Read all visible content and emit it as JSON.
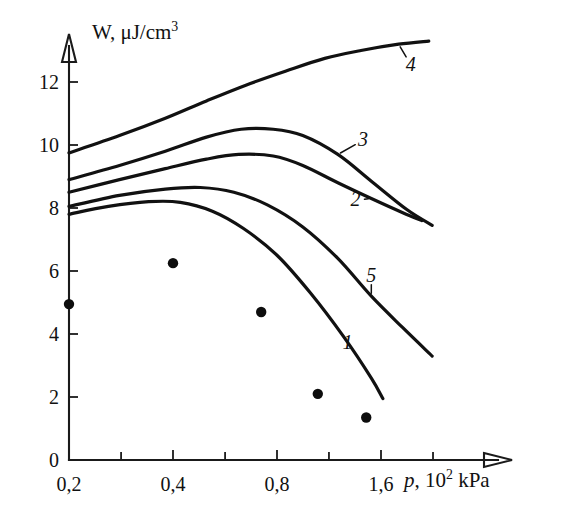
{
  "chart_data": {
    "type": "line",
    "title": "",
    "subtitle": "",
    "xlabel": "p, 10² kPa",
    "ylabel": "W, μJ/cm3",
    "x_axis": {
      "scale": "log2",
      "tick_labels": [
        "0,2",
        "0,4",
        "0,8",
        "1,6"
      ],
      "tick_values": [
        0.2,
        0.4,
        0.8,
        1.6
      ],
      "minor_ticks": [
        0.283,
        0.566,
        1.131,
        2.263
      ],
      "xlim": [
        0.2,
        2.4
      ]
    },
    "y_axis": {
      "scale": "linear",
      "tick_labels": [
        "0",
        "2",
        "4",
        "6",
        "8",
        "10",
        "12"
      ],
      "tick_values": [
        0,
        2,
        4,
        6,
        8,
        10,
        12
      ],
      "ylim": [
        0,
        13.6
      ]
    },
    "grid": false,
    "legend": "inline-curve-labels",
    "series": [
      {
        "name": "1",
        "label": "1",
        "style": "solid-line",
        "points": [
          {
            "x": 0.2,
            "y": 7.8
          },
          {
            "x": 0.26,
            "y": 8.05
          },
          {
            "x": 0.34,
            "y": 8.2
          },
          {
            "x": 0.42,
            "y": 8.18
          },
          {
            "x": 0.52,
            "y": 7.9
          },
          {
            "x": 0.64,
            "y": 7.35
          },
          {
            "x": 0.8,
            "y": 6.5
          },
          {
            "x": 1.0,
            "y": 5.3
          },
          {
            "x": 1.25,
            "y": 3.9
          },
          {
            "x": 1.5,
            "y": 2.6
          },
          {
            "x": 1.62,
            "y": 1.95
          }
        ],
        "label_position": {
          "x": 1.28,
          "y": 3.7
        }
      },
      {
        "name": "2",
        "label": "2",
        "style": "solid-line",
        "points": [
          {
            "x": 0.2,
            "y": 8.5
          },
          {
            "x": 0.28,
            "y": 8.9
          },
          {
            "x": 0.38,
            "y": 9.25
          },
          {
            "x": 0.5,
            "y": 9.55
          },
          {
            "x": 0.62,
            "y": 9.7
          },
          {
            "x": 0.78,
            "y": 9.65
          },
          {
            "x": 0.95,
            "y": 9.35
          },
          {
            "x": 1.2,
            "y": 8.8
          },
          {
            "x": 1.5,
            "y": 8.3
          },
          {
            "x": 1.85,
            "y": 7.85
          },
          {
            "x": 2.1,
            "y": 7.6
          }
        ],
        "label_position": {
          "x": 1.35,
          "y": 8.25
        }
      },
      {
        "name": "3",
        "label": "3",
        "style": "solid-line",
        "points": [
          {
            "x": 0.2,
            "y": 8.9
          },
          {
            "x": 0.28,
            "y": 9.35
          },
          {
            "x": 0.38,
            "y": 9.8
          },
          {
            "x": 0.5,
            "y": 10.25
          },
          {
            "x": 0.63,
            "y": 10.5
          },
          {
            "x": 0.78,
            "y": 10.5
          },
          {
            "x": 0.95,
            "y": 10.3
          },
          {
            "x": 1.2,
            "y": 9.7
          },
          {
            "x": 1.5,
            "y": 8.85
          },
          {
            "x": 1.9,
            "y": 7.95
          },
          {
            "x": 2.25,
            "y": 7.45
          }
        ],
        "label_position": {
          "x": 1.42,
          "y": 10.15
        }
      },
      {
        "name": "4",
        "label": "4",
        "style": "solid-line",
        "points": [
          {
            "x": 0.2,
            "y": 9.75
          },
          {
            "x": 0.28,
            "y": 10.3
          },
          {
            "x": 0.38,
            "y": 10.85
          },
          {
            "x": 0.5,
            "y": 11.4
          },
          {
            "x": 0.65,
            "y": 11.9
          },
          {
            "x": 0.85,
            "y": 12.35
          },
          {
            "x": 1.1,
            "y": 12.75
          },
          {
            "x": 1.4,
            "y": 13.0
          },
          {
            "x": 1.8,
            "y": 13.2
          },
          {
            "x": 2.2,
            "y": 13.3
          }
        ],
        "label_position": {
          "x": 1.95,
          "y": 12.55
        }
      },
      {
        "name": "5",
        "label": "5",
        "style": "solid-line",
        "points": [
          {
            "x": 0.2,
            "y": 8.05
          },
          {
            "x": 0.28,
            "y": 8.4
          },
          {
            "x": 0.38,
            "y": 8.6
          },
          {
            "x": 0.48,
            "y": 8.65
          },
          {
            "x": 0.6,
            "y": 8.5
          },
          {
            "x": 0.75,
            "y": 8.1
          },
          {
            "x": 0.95,
            "y": 7.4
          },
          {
            "x": 1.2,
            "y": 6.4
          },
          {
            "x": 1.5,
            "y": 5.2
          },
          {
            "x": 1.85,
            "y": 4.2
          },
          {
            "x": 2.25,
            "y": 3.3
          }
        ],
        "label_position": {
          "x": 1.5,
          "y": 5.85
        }
      }
    ],
    "scatter": {
      "name": "experimental points",
      "marker": "filled-circle",
      "points": [
        {
          "x": 0.2,
          "y": 4.95
        },
        {
          "x": 0.4,
          "y": 6.25
        },
        {
          "x": 0.72,
          "y": 4.7
        },
        {
          "x": 1.05,
          "y": 2.1
        },
        {
          "x": 1.45,
          "y": 1.35
        }
      ]
    }
  }
}
